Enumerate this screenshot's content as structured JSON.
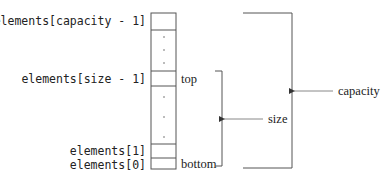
{
  "diagram": {
    "type": "array-based stack layout",
    "index_labels": {
      "capacity_minus_1": "elements[capacity - 1]",
      "size_minus_1": "elements[size - 1]",
      "one": "elements[1]",
      "zero": "elements[0]"
    },
    "cell_labels": {
      "top": "top",
      "bottom": "bottom"
    },
    "brackets": {
      "size": "size",
      "capacity": "capacity"
    },
    "ellipsis_dots": "·",
    "colors": {
      "line": "#555555",
      "text": "#222222",
      "arrow": "#777777"
    }
  }
}
